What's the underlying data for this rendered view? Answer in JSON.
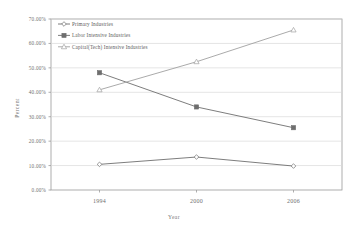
{
  "chart_data": {
    "type": "line",
    "title": "",
    "xlabel": "Year",
    "ylabel": "Percent",
    "categories": [
      "1994",
      "2000",
      "2006"
    ],
    "ylim": [
      0,
      70
    ],
    "ytick_labels": [
      "0.00%",
      "10.00%",
      "20.00%",
      "30.00%",
      "40.00%",
      "50.00%",
      "60.00%",
      "70.00%"
    ],
    "ytick_values": [
      0,
      10,
      20,
      30,
      40,
      50,
      60,
      70
    ],
    "grid": true,
    "legend_position": "top-left",
    "series": [
      {
        "name": "Primary Industries",
        "marker": "diamond-open",
        "color": "#6e6e6e",
        "values": [
          10.5,
          13.5,
          9.8
        ]
      },
      {
        "name": "Labor Intensive Industries",
        "marker": "square-filled",
        "color": "#6e6e6e",
        "values": [
          48.0,
          34.0,
          25.5
        ]
      },
      {
        "name": "Capital(Tech) Intensive Industries",
        "marker": "triangle-open",
        "color": "#a0a0a0",
        "values": [
          41.0,
          52.5,
          65.5
        ]
      }
    ]
  },
  "legend": {
    "items": [
      {
        "label": "Primary Industries"
      },
      {
        "label": "Labor Intensive Industries"
      },
      {
        "label": "Capital(Tech) Intensive Industries"
      }
    ]
  },
  "axes": {
    "y_title": "Percent",
    "x_title": "Year"
  }
}
